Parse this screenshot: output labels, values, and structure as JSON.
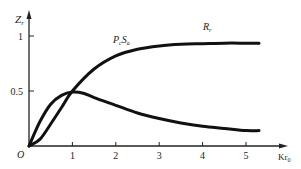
{
  "chart_data": {
    "type": "line",
    "title": "",
    "xlabel": "Kr₀",
    "ylabel": "Zr",
    "xlim": [
      0,
      5.4
    ],
    "ylim": [
      0,
      1.15
    ],
    "grid": false,
    "legend": "inline labels",
    "x_ticks": [
      "1",
      "2",
      "3",
      "4",
      "5"
    ],
    "y_ticks": [
      "0.5",
      "1"
    ],
    "origin_label": "O",
    "series": [
      {
        "name": "Rr",
        "label": "Rᵣ",
        "x": [
          0,
          0.25,
          0.5,
          0.75,
          1.0,
          1.5,
          2.0,
          2.5,
          3.0,
          3.5,
          4.0,
          4.5,
          5.0,
          5.3
        ],
        "values": [
          0,
          0.06,
          0.2,
          0.35,
          0.5,
          0.7,
          0.82,
          0.88,
          0.91,
          0.925,
          0.93,
          0.935,
          0.935,
          0.935
        ]
      },
      {
        "name": "PcSa",
        "label": "PᵣSₐ",
        "x": [
          0,
          0.25,
          0.5,
          0.75,
          1.0,
          1.25,
          1.5,
          2.0,
          2.5,
          3.0,
          3.5,
          4.0,
          4.5,
          5.0,
          5.3
        ],
        "values": [
          0,
          0.22,
          0.38,
          0.46,
          0.49,
          0.48,
          0.44,
          0.37,
          0.3,
          0.25,
          0.21,
          0.18,
          0.16,
          0.14,
          0.14
        ]
      }
    ]
  }
}
